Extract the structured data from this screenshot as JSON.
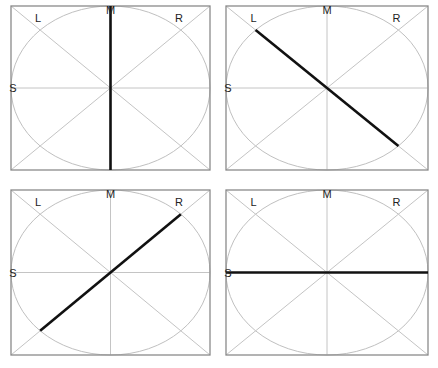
{
  "diagram": {
    "title": "",
    "labels": {
      "top": "M",
      "upper_left": "L",
      "upper_right": "R",
      "left": "S"
    },
    "colors": {
      "frame": "#8a8a8a",
      "guides": "#c4c4c4",
      "trace": "#111111"
    },
    "panels": [
      {
        "id": "top-left",
        "x": 11,
        "y": 6,
        "w": 199,
        "h": 164,
        "trace": "vertical",
        "trace_from": "M",
        "trace_to": "bottom"
      },
      {
        "id": "top-right",
        "x": 226,
        "y": 6,
        "w": 202,
        "h": 164,
        "trace": "diagonal-L",
        "trace_from": "L",
        "trace_to": "lower-right ellipse"
      },
      {
        "id": "bottom-left",
        "x": 11,
        "y": 190,
        "w": 199,
        "h": 165,
        "trace": "diagonal-R",
        "trace_from": "lower-left ellipse",
        "trace_to": "R"
      },
      {
        "id": "bottom-right",
        "x": 226,
        "y": 190,
        "w": 202,
        "h": 165,
        "trace": "horizontal",
        "trace_from": "S",
        "trace_to": "right edge"
      }
    ]
  }
}
